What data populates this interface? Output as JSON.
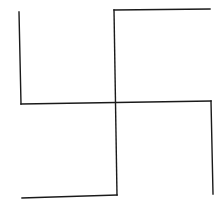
{
  "canvas": {
    "width": 221,
    "height": 202,
    "background": "#ffffff"
  },
  "stroke": {
    "color": "#1a1a1a",
    "width": 1.4
  },
  "segments": [
    {
      "name": "left-vertical-arm",
      "x1": 19,
      "y1": 12,
      "x2": 21,
      "y2": 104
    },
    {
      "name": "center-horizontal",
      "x1": 21,
      "y1": 104,
      "x2": 211,
      "y2": 101
    },
    {
      "name": "right-vertical-arm",
      "x1": 211,
      "y1": 101,
      "x2": 213,
      "y2": 194
    },
    {
      "name": "top-horizontal-arm",
      "x1": 114,
      "y1": 10,
      "x2": 210,
      "y2": 9
    },
    {
      "name": "center-vertical",
      "x1": 114,
      "y1": 10,
      "x2": 117,
      "y2": 195
    },
    {
      "name": "bottom-horizontal-arm",
      "x1": 117,
      "y1": 195,
      "x2": 22,
      "y2": 198
    }
  ]
}
